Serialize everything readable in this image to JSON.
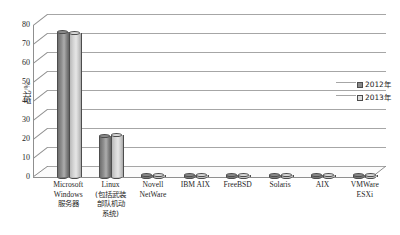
{
  "chart_data": {
    "type": "bar",
    "title": "",
    "xlabel": "",
    "ylabel": "占比/%",
    "ylim": [
      0,
      80
    ],
    "yticks": [
      0,
      10,
      20,
      30,
      40,
      50,
      60,
      70,
      80
    ],
    "grid": true,
    "legend_position": "right",
    "style": "3d-cylinder",
    "categories": [
      "Microsoft Windows 服务器",
      "Linux (包括武装部队机动系统)",
      "Novell NetWare",
      "IBM AIX",
      "FreeBSD",
      "Solaris",
      "AIX",
      "VMWare ESXi"
    ],
    "category_lines": [
      [
        "Microsoft",
        "Windows",
        "服务器"
      ],
      [
        "Linux",
        "(包括武装",
        "部队机动",
        "系统)"
      ],
      [
        "Novell",
        "NetWare"
      ],
      [
        "IBM AIX"
      ],
      [
        "FreeBSD"
      ],
      [
        "Solaris"
      ],
      [
        "AIX"
      ],
      [
        "VMWare",
        "ESXi"
      ]
    ],
    "series": [
      {
        "name": "2012年",
        "color": "#8a8a8a",
        "values": [
          76.5,
          21.5,
          1.0,
          1.0,
          1.0,
          1.0,
          1.0,
          1.0
        ]
      },
      {
        "name": "2013年",
        "color": "#dedede",
        "values": [
          76.0,
          22.0,
          1.0,
          1.0,
          1.0,
          1.0,
          1.0,
          1.0
        ]
      }
    ]
  },
  "axis": {
    "y_label": "占比/%",
    "y_ticks": [
      "0",
      "10",
      "20",
      "30",
      "40",
      "50",
      "60",
      "70",
      "80"
    ]
  },
  "legend": {
    "items": [
      {
        "label": "2012年",
        "swatch": "dark"
      },
      {
        "label": "2013年",
        "swatch": "light"
      }
    ]
  }
}
